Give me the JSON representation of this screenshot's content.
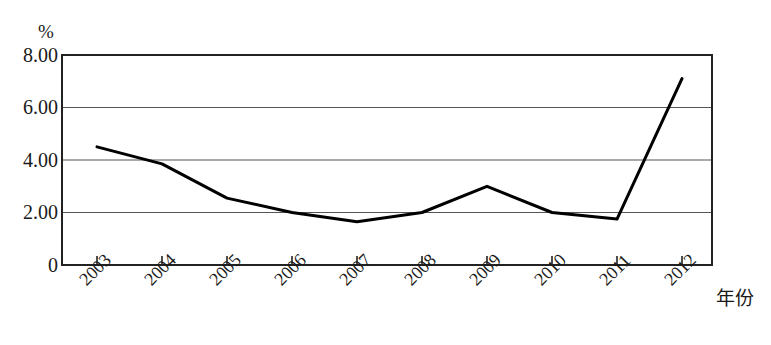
{
  "chart_data": {
    "type": "line",
    "title": "",
    "subtitle": "",
    "xlabel": "年份",
    "ylabel": "%",
    "y_unit": "%",
    "categories": [
      "2003",
      "2004",
      "2005",
      "2006",
      "2007",
      "2008",
      "2009",
      "2010",
      "2011",
      "2012"
    ],
    "values": [
      4.5,
      3.85,
      2.55,
      2.0,
      1.65,
      2.0,
      3.0,
      2.0,
      1.75,
      7.1
    ],
    "series": [
      {
        "name": "",
        "values": [
          4.5,
          3.85,
          2.55,
          2.0,
          1.65,
          2.0,
          3.0,
          2.0,
          1.75,
          7.1
        ]
      }
    ],
    "ylim": [
      0,
      8
    ],
    "xlim": [
      "2003",
      "2012"
    ],
    "y_ticks": [
      0,
      2,
      4,
      6,
      8
    ],
    "y_tick_labels": [
      "0",
      "2.00",
      "4.00",
      "6.00",
      "8.00"
    ],
    "grid": true,
    "grid_axis": "y",
    "legend": false,
    "legend_position": "none",
    "line_color": "#000000",
    "line_width": 3,
    "markers": false,
    "plot_border": true,
    "xtick_label_rotation": -45,
    "annotations": []
  },
  "axes": {
    "y_unit_label": "%",
    "x_title": "年份",
    "y_tick_labels": [
      "8.00",
      "6.00",
      "4.00",
      "2.00",
      "0"
    ],
    "x_tick_labels": [
      "2003",
      "2004",
      "2005",
      "2006",
      "2007",
      "2008",
      "2009",
      "2010",
      "2011",
      "2012"
    ]
  },
  "colors": {
    "line": "#000000",
    "grid": "#555555",
    "border": "#222222",
    "background": "#ffffff",
    "text": "#1a1a1a"
  }
}
